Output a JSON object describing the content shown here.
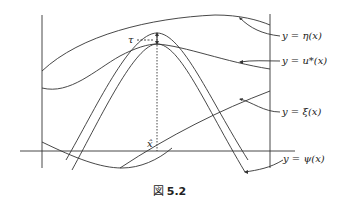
{
  "figure": {
    "caption_prefix": "図",
    "caption_number": "5.2",
    "labels": {
      "eta": "y = η(x)",
      "u_star": "y = u*(x)",
      "xi": "y = ξ(x)",
      "psi": "y = ψ(x)",
      "tau": "τ",
      "x_hat": "x̂"
    },
    "colors": {
      "stroke": "#333333",
      "background": "#ffffff"
    }
  }
}
